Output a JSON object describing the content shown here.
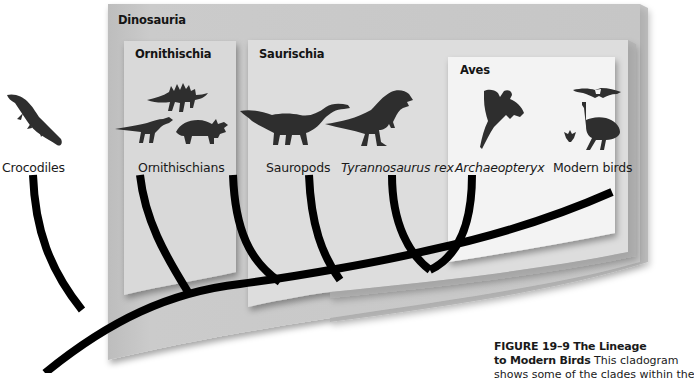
{
  "figure": {
    "number_label": "FIGURE 19–9",
    "title": "The Lineage to Modern Birds",
    "title_line1": "The Lineage",
    "title_line2": "to Modern Birds",
    "body_start": "This cladogram",
    "body_line3_partial": "shows some of the clades within the"
  },
  "groups": {
    "dinosauria": {
      "label": "Dinosauria"
    },
    "ornithischia": {
      "label": "Ornithischia"
    },
    "saurischia": {
      "label": "Saurischia"
    },
    "aves": {
      "label": "Aves"
    }
  },
  "taxa": [
    {
      "label": "Crocodiles",
      "italic": false,
      "icon": "crocodile-icon"
    },
    {
      "label": "Ornithischians",
      "italic": false,
      "icon": "ornithischian-dinosaurs-icon"
    },
    {
      "label": "Sauropods",
      "italic": false,
      "icon": "sauropod-icon"
    },
    {
      "label": "Tyrannosaurus rex",
      "italic": true,
      "icon": "tyrannosaurus-icon"
    },
    {
      "label": "Archaeopteryx",
      "italic": true,
      "icon": "archaeopteryx-icon"
    },
    {
      "label": "Modern birds",
      "italic": false,
      "icon": "modern-birds-icon"
    }
  ],
  "colors": {
    "dinosauria_panel": "#c9c9c9",
    "ornithischia_panel": "#d9d9d9",
    "saurischia_panel": "#dedede",
    "aves_panel": "#f2f2f2",
    "branch": "#000000",
    "silhouette": "#2e2e2e"
  }
}
